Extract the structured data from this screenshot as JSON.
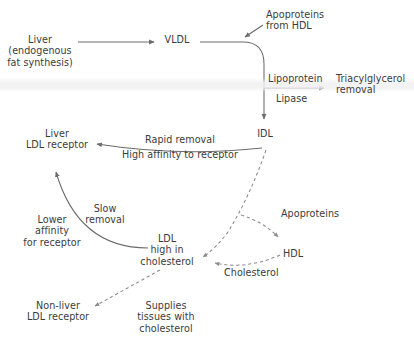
{
  "diagram": {
    "text_color": "#3b3b3b",
    "line_color": "#6b6b6b",
    "background": "#ffffff",
    "nodes": {
      "liver_source": "Liver\n(endogenous\nfat synthesis)",
      "vldl": "VLDL",
      "apoproteins_from_hdl": "Apoproteins\nfrom HDL",
      "lipoprotein": "Lipoprotein",
      "lipase": "Lipase",
      "triacylglycerol_removal": "Triacylglycerol\nremoval",
      "idl": "IDL",
      "liver_ldl_receptor": "Liver\nLDL receptor",
      "rapid_removal": "Rapid removal",
      "high_affinity": "High affinity to receptor",
      "slow_removal": "Slow\nremoval",
      "lower_affinity": "Lower\naffinity\nfor receptor",
      "ldl": "LDL\nhigh in\ncholesterol",
      "apoproteins": "Apoproteins",
      "hdl": "HDL",
      "cholesterol": "Cholesterol",
      "non_liver_ldl_receptor": "Non-liver\nLDL receptor",
      "supplies_tissues": "Supplies\ntissues with\ncholesterol"
    },
    "edges": [
      {
        "name": "liver-to-vldl",
        "style": "solid",
        "label": ""
      },
      {
        "name": "vldl-to-idl",
        "style": "solid",
        "label": ""
      },
      {
        "name": "apoproteins-from-hdl-into-vldl",
        "style": "solid",
        "label": "Apoproteins from HDL"
      },
      {
        "name": "lipoprotein-lipase-to-triacylglycerol-removal",
        "style": "solid",
        "label": "Lipoprotein Lipase"
      },
      {
        "name": "idl-to-liver-ldl-receptor",
        "style": "solid",
        "label": "Rapid removal / High affinity to receptor"
      },
      {
        "name": "ldl-to-liver-ldl-receptor",
        "style": "solid",
        "label": "Slow removal / Lower affinity for receptor"
      },
      {
        "name": "idl-to-ldl",
        "style": "dashed",
        "label": ""
      },
      {
        "name": "idl-to-hdl",
        "style": "dashed",
        "label": "Apoproteins"
      },
      {
        "name": "hdl-to-ldl",
        "style": "dashed",
        "label": "Cholesterol"
      },
      {
        "name": "ldl-to-non-liver-ldl-receptor",
        "style": "dashed",
        "label": "Supplies tissues with cholesterol"
      }
    ]
  }
}
